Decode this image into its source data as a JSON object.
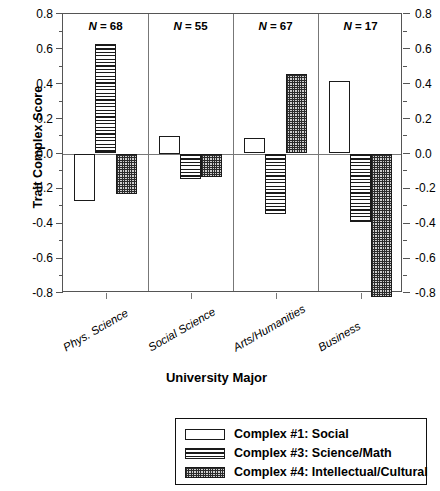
{
  "chart_data": {
    "type": "bar",
    "title": "",
    "xlabel": "University Major",
    "ylabel": "Trait Complex Score",
    "ylim": [
      -0.8,
      0.8
    ],
    "yticks": [
      "0.8",
      "0.6",
      "0.4",
      "0.2",
      "0.0",
      "-0.2",
      "-0.4",
      "-0.6",
      "-0.8"
    ],
    "ytick_values": [
      0.8,
      0.6,
      0.4,
      0.2,
      0.0,
      -0.2,
      -0.4,
      -0.6,
      -0.8
    ],
    "grid": false,
    "legend_position": "bottom",
    "dual_y_axis": true,
    "categories": [
      "Phys. Science",
      "Social Science",
      "Arts/Humanities",
      "Business"
    ],
    "annotations": [
      "N = 68",
      "N = 55",
      "N = 67",
      "N = 17"
    ],
    "group_sizes": [
      68,
      55,
      67,
      17
    ],
    "series": [
      {
        "name": "Complex #1: Social",
        "pattern": "open",
        "values": [
          -0.27,
          0.1,
          0.09,
          0.415
        ]
      },
      {
        "name": "Complex #3: Science/Math",
        "pattern": "horizontal-lines",
        "values": [
          0.63,
          -0.145,
          -0.345,
          -0.39
        ]
      },
      {
        "name": "Complex #4: Intellectual/Cultural",
        "pattern": "checkerboard",
        "values": [
          -0.235,
          -0.135,
          0.455,
          -0.825
        ]
      }
    ]
  },
  "axes": {
    "y_title": "Trait Complex Score",
    "x_title": "University Major"
  },
  "legend": {
    "entries": [
      {
        "label": "Complex #1: Social",
        "pattern": "open"
      },
      {
        "label": "Complex #3: Science/Math",
        "pattern": "horizontal-lines"
      },
      {
        "label": "Complex #4: Intellectual/Cultural",
        "pattern": "checkerboard"
      }
    ]
  },
  "colors": {
    "frame": "#555555",
    "bar_outline": "#1a1a1a",
    "pattern_ink": "#2b2b2b",
    "background": "#ffffff"
  }
}
